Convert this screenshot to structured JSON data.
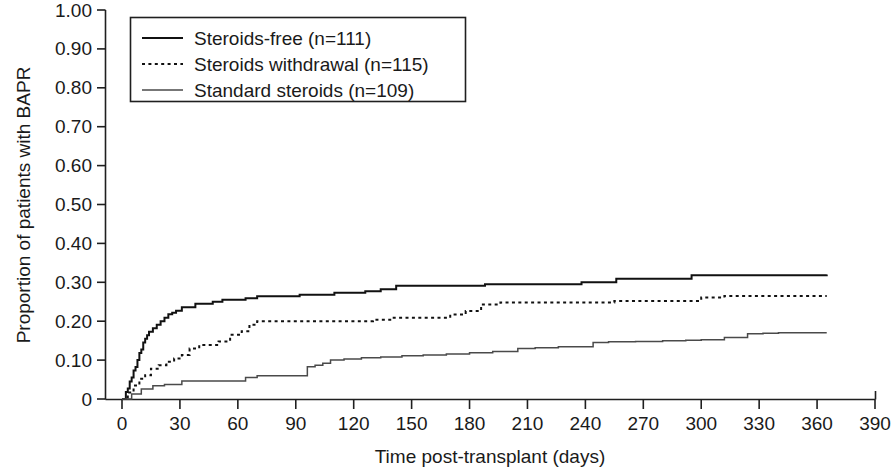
{
  "chart_data": {
    "type": "line",
    "title": "",
    "xlabel": "Time post-transplant (days)",
    "ylabel": "Proportion of patients with BAPR",
    "xlim": [
      0,
      390
    ],
    "ylim": [
      0,
      1.0
    ],
    "grid": false,
    "legend_position": "top-left",
    "x_ticks": [
      "0",
      "30",
      "60",
      "90",
      "120",
      "150",
      "180",
      "210",
      "240",
      "270",
      "300",
      "330",
      "360",
      "390"
    ],
    "x_tick_values": [
      0,
      30,
      60,
      90,
      120,
      150,
      180,
      210,
      240,
      270,
      300,
      330,
      360,
      390
    ],
    "y_ticks": [
      "0",
      "0.10",
      "0.20",
      "0.30",
      "0.40",
      "0.50",
      "0.60",
      "0.70",
      "0.80",
      "0.90",
      "1.00"
    ],
    "y_tick_values": [
      0,
      0.1,
      0.2,
      0.3,
      0.4,
      0.5,
      0.6,
      0.7,
      0.8,
      0.9,
      1.0
    ],
    "series": [
      {
        "name": "Steroids-free (n=111)",
        "label": "Steroids-free (n=111)",
        "style": "solid-thick",
        "n": 111,
        "final_value": 0.32,
        "x": [
          0,
          2,
          3,
          4,
          5,
          6,
          7,
          8,
          9,
          10,
          11,
          12,
          13,
          14,
          16,
          18,
          20,
          22,
          24,
          26,
          28,
          31,
          34,
          38,
          42,
          47,
          52,
          58,
          64,
          70,
          77,
          84,
          92,
          100,
          110,
          118,
          126,
          134,
          142,
          152,
          162,
          175,
          188,
          200,
          212,
          224,
          238,
          248,
          256,
          268,
          282,
          295,
          310,
          330,
          350,
          365
        ],
        "y": [
          0.0,
          0.018,
          0.027,
          0.045,
          0.055,
          0.073,
          0.082,
          0.1,
          0.118,
          0.127,
          0.145,
          0.155,
          0.164,
          0.173,
          0.182,
          0.191,
          0.2,
          0.209,
          0.218,
          0.222,
          0.227,
          0.236,
          0.236,
          0.245,
          0.245,
          0.25,
          0.255,
          0.255,
          0.259,
          0.264,
          0.264,
          0.264,
          0.268,
          0.268,
          0.273,
          0.273,
          0.277,
          0.282,
          0.291,
          0.291,
          0.291,
          0.291,
          0.295,
          0.295,
          0.295,
          0.295,
          0.3,
          0.3,
          0.309,
          0.309,
          0.309,
          0.318,
          0.318,
          0.318,
          0.318,
          0.32
        ]
      },
      {
        "name": "Steroids withdrawal (n=115)",
        "label": "Steroids withdrawal (n=115)",
        "style": "dotted",
        "n": 115,
        "final_value": 0.265,
        "x": [
          0,
          3,
          6,
          9,
          12,
          15,
          19,
          23,
          27,
          31,
          35,
          40,
          45,
          50,
          56,
          62,
          66,
          70,
          76,
          84,
          92,
          100,
          110,
          120,
          130,
          140,
          150,
          160,
          170,
          178,
          186,
          196,
          210,
          225,
          240,
          255,
          268,
          280,
          292,
          300,
          312,
          330,
          350,
          365
        ],
        "y": [
          0.0,
          0.017,
          0.035,
          0.052,
          0.061,
          0.078,
          0.087,
          0.096,
          0.104,
          0.113,
          0.13,
          0.139,
          0.139,
          0.148,
          0.165,
          0.174,
          0.191,
          0.2,
          0.2,
          0.2,
          0.2,
          0.2,
          0.2,
          0.2,
          0.204,
          0.209,
          0.209,
          0.209,
          0.217,
          0.226,
          0.243,
          0.248,
          0.248,
          0.248,
          0.248,
          0.252,
          0.252,
          0.252,
          0.252,
          0.261,
          0.265,
          0.265,
          0.265,
          0.265
        ]
      },
      {
        "name": "Standard steroids (n=109)",
        "label": "Standard steroids (n=109)",
        "style": "solid-thin",
        "n": 109,
        "final_value": 0.17,
        "x": [
          0,
          5,
          10,
          16,
          22,
          28,
          31,
          40,
          50,
          60,
          64,
          70,
          80,
          88,
          92,
          96,
          100,
          104,
          108,
          115,
          124,
          134,
          145,
          156,
          168,
          180,
          192,
          205,
          214,
          226,
          238,
          244,
          252,
          266,
          280,
          292,
          300,
          312,
          324,
          332,
          340,
          352,
          365
        ],
        "y": [
          0.0,
          0.013,
          0.026,
          0.034,
          0.037,
          0.037,
          0.046,
          0.046,
          0.046,
          0.046,
          0.055,
          0.06,
          0.06,
          0.06,
          0.06,
          0.083,
          0.087,
          0.092,
          0.1,
          0.103,
          0.106,
          0.108,
          0.111,
          0.113,
          0.116,
          0.119,
          0.122,
          0.13,
          0.132,
          0.134,
          0.134,
          0.145,
          0.147,
          0.148,
          0.15,
          0.151,
          0.152,
          0.158,
          0.168,
          0.169,
          0.17,
          0.17,
          0.17
        ]
      }
    ]
  },
  "legend": {
    "entries": [
      {
        "label": "Steroids-free (n=111)",
        "style": "solid-thick"
      },
      {
        "label": "Steroids withdrawal (n=115)",
        "style": "dotted"
      },
      {
        "label": "Standard steroids (n=109)",
        "style": "solid-thin"
      }
    ]
  },
  "colors": {
    "axis": "#1f1f1f",
    "series_1": "#111111",
    "series_2": "#111111",
    "series_3": "#4a4a4a",
    "background": "#ffffff"
  }
}
